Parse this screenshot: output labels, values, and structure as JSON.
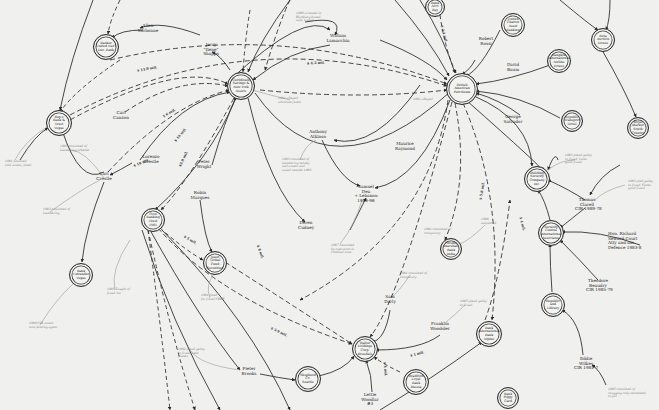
{
  "diagram": {
    "type": "hand-drawn network / link chart",
    "colors": {
      "background": "#f0f0ee",
      "ink": "#2a2a2a",
      "annotation_ink": "#777777"
    },
    "nodes": [
      {
        "id": "n_top1",
        "label": "Banker\nUnited Nat'l\nDev. Bank",
        "x": 105,
        "y": 46,
        "r": 12
      },
      {
        "id": "n_rep",
        "label": "Rep's\nBank &\nTrust\nVegas",
        "x": 58,
        "y": 122,
        "r": 12
      },
      {
        "id": "n_asset",
        "label": "Certificate\nSavings &\nNew York\nAssets",
        "x": 240,
        "y": 85,
        "r": 13
      },
      {
        "id": "n_brit",
        "label": "British\nAmerican\nPetroleum",
        "x": 461,
        "y": 88,
        "r": 15
      },
      {
        "id": "n_topA",
        "label": "Bank\nAcct\nBay",
        "x": 434,
        "y": 6,
        "r": 9
      },
      {
        "id": "n_topB",
        "label": "United\nCharter\nAsset\nBanking",
        "x": 512,
        "y": 24,
        "r": 11
      },
      {
        "id": "n_topC",
        "label": "Beta\nAuction\nHouse",
        "x": 602,
        "y": 39,
        "r": 11
      },
      {
        "id": "n_ind",
        "label": "Bangkok\nInternational\nAirline\nHouse",
        "x": 558,
        "y": 60,
        "r": 11
      },
      {
        "id": "n_tramp",
        "label": "Republic\nTransport\nHotel",
        "x": 571,
        "y": 120,
        "r": 10
      },
      {
        "id": "n_rsvc",
        "label": "Royal\nMarket\nSouth\nCountry",
        "x": 637,
        "y": 127,
        "r": 10
      },
      {
        "id": "n_bldg",
        "label": "Building\nSecurity\nCompany\nInc.",
        "x": 536,
        "y": 178,
        "r": 12
      },
      {
        "id": "n_corp",
        "label": "Security\nCentral\nInternational\nAssociates",
        "x": 550,
        "y": 232,
        "r": 12
      },
      {
        "id": "n_phb",
        "label": "Phoebe\nMarshall\nBank\nIndia",
        "x": 450,
        "y": 248,
        "r": 10
      },
      {
        "id": "n_first",
        "label": "First\nBanking\nTrust\n1981",
        "x": 152,
        "y": 219,
        "r": 11
      },
      {
        "id": "n_ostr",
        "label": "Bank\nOstrander\nVegas",
        "x": 80,
        "y": 274,
        "r": 11
      },
      {
        "id": "n_mid",
        "label": "Asset\nGlobal\nFund\nSecurities",
        "x": 214,
        "y": 262,
        "r": 11
      },
      {
        "id": "n_walter",
        "label": "Walter\nHoldings\nCorp.\nRosedale",
        "x": 364,
        "y": 348,
        "r": 12
      },
      {
        "id": "n_seal",
        "label": "Shepherd\nCo.\nSeattle",
        "x": 307,
        "y": 378,
        "r": 12
      },
      {
        "id": "n_east",
        "label": "Bank\nInternational\nBank\nAlpine",
        "x": 488,
        "y": 333,
        "r": 12
      },
      {
        "id": "n_hard",
        "label": "Bradford\nLoyal\nBank\nRussia",
        "x": 415,
        "y": 381,
        "r": 12
      },
      {
        "id": "n_lan",
        "label": "Republic\nand\nLibrary",
        "x": 552,
        "y": 304,
        "r": 11
      },
      {
        "id": "n_btm",
        "label": "Bank\nPiggy\nCard",
        "x": 507,
        "y": 397,
        "r": 10
      }
    ],
    "people": [
      {
        "id": "p_sorbonne",
        "label": "Allen\nSorbonne",
        "x": 148,
        "y": 29
      },
      {
        "id": "p_genn",
        "label": "Jerry\n\"Gene\"\nShapps",
        "x": 211,
        "y": 48
      },
      {
        "id": "p_lamacchia",
        "label": "William\nLamacchia",
        "x": 338,
        "y": 39
      },
      {
        "id": "p_rossi",
        "label": "Robert\nRossi",
        "x": 486,
        "y": 42
      },
      {
        "id": "p_baum",
        "label": "David\nBaum",
        "x": 513,
        "y": 68
      },
      {
        "id": "p_salvador",
        "label": "George\nSalvador",
        "x": 513,
        "y": 120
      },
      {
        "id": "p_carl",
        "label": "Carl\nCanzon",
        "x": 121,
        "y": 116
      },
      {
        "id": "p_lorenzo",
        "label": "Lorenzo\nCrestle",
        "x": 151,
        "y": 160
      },
      {
        "id": "p_edcrestle",
        "label": "Carl\nCrestle",
        "x": 104,
        "y": 177
      },
      {
        "id": "p_wright",
        "label": "Peter\nWright",
        "x": 204,
        "y": 165
      },
      {
        "id": "p_marques",
        "label": "Robin\nMarques",
        "x": 200,
        "y": 196
      },
      {
        "id": "p_antinia",
        "label": "Anthony\nAtkinso",
        "x": 318,
        "y": 135
      },
      {
        "id": "p_raymond",
        "label": "Maurice\nRaymond",
        "x": 405,
        "y": 147
      },
      {
        "id": "p_samuel",
        "label": "Samuel\nDea\n+ Lebanon\n1986-96",
        "x": 366,
        "y": 190
      },
      {
        "id": "p_cudney",
        "label": "Deren\nCudney",
        "x": 306,
        "y": 226
      },
      {
        "id": "p_thomas",
        "label": "Thomas\nClarell\nCIR 1989-78",
        "x": 587,
        "y": 203
      },
      {
        "id": "p_richard",
        "label": "Hon. Richard\nSeward Court\nAtty and ass.\nDefence 1983-8",
        "x": 620,
        "y": 237
      },
      {
        "id": "p_theodore",
        "label": "Theodore\nBeaudry\nCIR 1985-79",
        "x": 598,
        "y": 284
      },
      {
        "id": "p_sam",
        "label": "Sam\nDarly",
        "x": 390,
        "y": 300
      },
      {
        "id": "p_franklin",
        "label": "Franklin\nWoodsler",
        "x": 440,
        "y": 327
      },
      {
        "id": "p_pieter",
        "label": "Pieter\nBrooks",
        "x": 249,
        "y": 372
      },
      {
        "id": "p_lettie",
        "label": "Lettie\nWoodlar\n#3",
        "x": 370,
        "y": 398
      },
      {
        "id": "p_eddie",
        "label": "Eddie\nWilkes\nCIR 1981-7",
        "x": 586,
        "y": 362
      }
    ],
    "annotations": [
      {
        "label": "1986 arrested in\nHamburg-based\nsafe, transit",
        "x": 296,
        "y": 12
      },
      {
        "label": "1981 alleged\nadvocate funds",
        "x": 278,
        "y": 97
      },
      {
        "label": "1981 alleged",
        "x": 413,
        "y": 98
      },
      {
        "label": "1983 convicted of\nlaundering money\nand assets and\nsaved outside 1983",
        "x": 282,
        "y": 158
      },
      {
        "label": "1987 convicted\nby operation in\ncriminal case",
        "x": 331,
        "y": 244
      },
      {
        "label": "1985 convicted of\nlaundering scheme",
        "x": 60,
        "y": 145
      },
      {
        "label": "1981 finalised\nsold assets, fined",
        "x": 5,
        "y": 160
      },
      {
        "label": "1983 convicted of\nlaundering",
        "x": 43,
        "y": 208
      },
      {
        "label": "1981 convicted of\nconspiracy",
        "x": 424,
        "y": 228
      },
      {
        "label": "1988\nsuspected",
        "x": 481,
        "y": 218
      },
      {
        "label": "1983 plead guilty\nto fraud; faces\ngood fraud",
        "x": 565,
        "y": 154
      },
      {
        "label": "1983 pled guilty\nto fraud. Faces\ngood fraud",
        "x": 628,
        "y": 180
      },
      {
        "label": "1985 Taught of\nfraud 1st",
        "x": 107,
        "y": 288
      },
      {
        "label": "1988 CIA assets\nnow fencing agent",
        "x": 29,
        "y": 322
      },
      {
        "label": "1981 fined\nfor fraud CHEF",
        "x": 201,
        "y": 294
      },
      {
        "label": "1982 plead guilty\nto fraud; sent\nplanes",
        "x": 178,
        "y": 348
      },
      {
        "label": "1981 convicted of\nconspiracy",
        "x": 400,
        "y": 272
      },
      {
        "label": "1985 plead guilty\nto fraud",
        "x": 460,
        "y": 300
      },
      {
        "label": "1985 convicted of\nsnagging only sentenced\nto jail",
        "x": 608,
        "y": 388
      }
    ],
    "edge_labels": [
      {
        "label": "$ 11.8 mil.",
        "x": 137,
        "y": 67,
        "rot": -10
      },
      {
        "label": "$ 4.2 mil.",
        "x": 307,
        "y": 61,
        "rot": -3
      },
      {
        "label": "$ 6 mil.",
        "x": 162,
        "y": 111,
        "rot": -30
      },
      {
        "label": "$ 19 mil.",
        "x": 172,
        "y": 133,
        "rot": -50
      },
      {
        "label": "$3.9 mil.",
        "x": 175,
        "y": 157,
        "rot": -65
      },
      {
        "label": "$ 18 mil.",
        "x": 133,
        "y": 161,
        "rot": -22
      },
      {
        "label": "$ 3.1 mil.",
        "x": 435,
        "y": 32,
        "rot": 75
      },
      {
        "label": "$ 5.8 mil.",
        "x": 473,
        "y": 189,
        "rot": -80
      },
      {
        "label": "$ 4 mil.",
        "x": 515,
        "y": 222,
        "rot": 75
      },
      {
        "label": "$ 5 mil.",
        "x": 183,
        "y": 238,
        "rot": 30
      },
      {
        "label": "$ 8 mil.",
        "x": 253,
        "y": 250,
        "rot": 70
      },
      {
        "label": "$ 5.9 mil.",
        "x": 270,
        "y": 330,
        "rot": 25
      },
      {
        "label": "$ 4 mil.",
        "x": 378,
        "y": 367,
        "rot": 85
      },
      {
        "label": "$ 1 mil.",
        "x": 410,
        "y": 352,
        "rot": -15
      }
    ]
  }
}
